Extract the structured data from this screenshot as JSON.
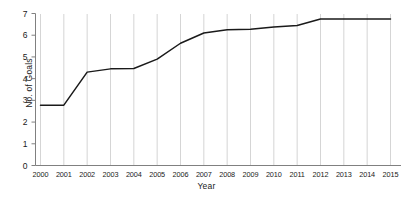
{
  "chart_data": {
    "type": "line",
    "title": "",
    "xlabel": "Year",
    "ylabel": "No. of Goals",
    "categories": [
      "2000",
      "2001",
      "2002",
      "2003",
      "2004",
      "2005",
      "2006",
      "2007",
      "2008",
      "2009",
      "2010",
      "2011",
      "2012",
      "2013",
      "2014",
      "2015"
    ],
    "values": [
      2.78,
      2.78,
      4.3,
      4.45,
      4.47,
      4.9,
      5.63,
      6.1,
      6.25,
      6.27,
      6.38,
      6.45,
      6.75,
      6.75,
      6.75,
      6.75
    ],
    "series": [
      {
        "name": "No. of Goals",
        "values": [
          2.78,
          2.78,
          4.3,
          4.45,
          4.47,
          4.9,
          5.63,
          6.1,
          6.25,
          6.27,
          6.38,
          6.45,
          6.75,
          6.75,
          6.75,
          6.75
        ]
      }
    ],
    "ylim": [
      0,
      7
    ],
    "yticks": [
      0,
      1,
      2,
      3,
      4,
      5,
      6,
      7
    ],
    "ytick_labels": [
      "0",
      "1",
      "2",
      "3",
      "4",
      "5",
      "6",
      "7"
    ],
    "grid": "vertical-only",
    "legend": "none",
    "line_color": "#1a1a1a",
    "grid_color": "#b8b8b8",
    "axis_color": "#808080"
  }
}
